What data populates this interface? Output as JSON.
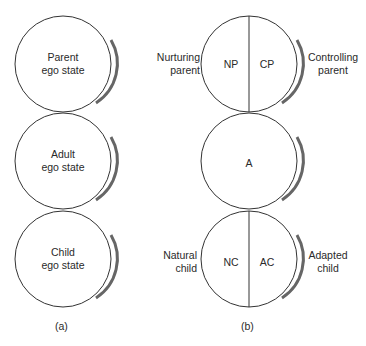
{
  "diagram_a": {
    "caption": "(a)",
    "circles": [
      {
        "label": "Parent\nego state"
      },
      {
        "label": "Adult\nego state"
      },
      {
        "label": "Child\nego state"
      }
    ]
  },
  "diagram_b": {
    "caption": "(b)",
    "parent": {
      "left": "NP",
      "right": "CP",
      "left_desc": "Nurturing\nparent",
      "right_desc": "Controlling\nparent"
    },
    "adult": {
      "label": "A"
    },
    "child": {
      "left": "NC",
      "right": "AC",
      "left_desc": "Natural\nchild",
      "right_desc": "Adapted\nchild"
    }
  },
  "colors": {
    "stroke": "#333333",
    "shadow": "#555555"
  }
}
